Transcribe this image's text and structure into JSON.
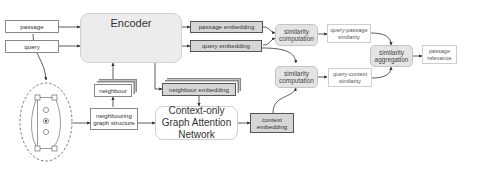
{
  "diagram": {
    "inputs": {
      "passage": "passage",
      "query": "query"
    },
    "encoder": {
      "label": "Encoder"
    },
    "embeddings": {
      "passage": "passage embedding",
      "query": "query embedding",
      "neighbour": "neighbour embedding",
      "context": "context embedding"
    },
    "neighbour": "neighbour",
    "neighbouring_graph_structure": "neighbouring graph structure",
    "gat": "Context-only Graph Attention Network",
    "similarity_top": "similarity computation",
    "similarity_bottom": "similarity computation",
    "query_passage_similarity": "query-passage similarity",
    "query_context_similarity": "query-context similarity",
    "aggregation": "similarity aggregation",
    "output": "passage relevance",
    "colors": {
      "grey_box": "#d6d6d6",
      "encoder_fill": "#ececec",
      "line": "#333333"
    }
  }
}
